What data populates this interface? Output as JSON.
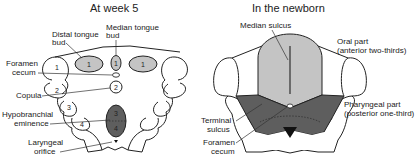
{
  "left_panel": {
    "title": "At week 5",
    "labels": {
      "distal_tongue_bud_1": "Distal tongue",
      "distal_tongue_bud_2": "bud",
      "median_tongue_bud_1": "Median tongue",
      "median_tongue_bud_2": "bud",
      "foramen_cecum_1": "Foramen",
      "foramen_cecum_2": "cecum",
      "copula": "Copula",
      "hypobranchial_1": "Hypobranchial",
      "hypobranchial_2": "eminence",
      "laryngeal_1": "Laryngeal",
      "laryngeal_2": "orifice"
    },
    "arch_numbers": {
      "a1": "1",
      "a2": "2",
      "a3": "3",
      "a4": "4",
      "distal_left": "1",
      "distal_right": "1",
      "median": "1",
      "copula": "2",
      "hypo_top": "3",
      "hypo_bottom": "4"
    }
  },
  "right_panel": {
    "title": "In the newborn",
    "labels": {
      "median_sulcus": "Median sulcus",
      "oral_part_1": "Oral part",
      "oral_part_2": "(anterior two-thirds)",
      "pharyngeal_part_1": "Pharyngeal part",
      "pharyngeal_part_2": "(posterior one-third)",
      "terminal_sulcus_1": "Terminal",
      "terminal_sulcus_2": "sulcus",
      "foramen_cecum_1": "Foramen",
      "foramen_cecum_2": "cecum"
    }
  },
  "colors": {
    "light_gray": "#c4c4c4",
    "dark_gray": "#5e5e5e",
    "outline": "#222222",
    "background": "#ffffff"
  }
}
